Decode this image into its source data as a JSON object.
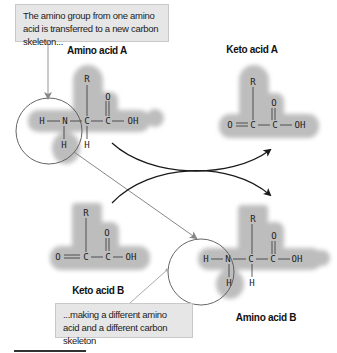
{
  "callouts": {
    "top": "The amino group from one amino acid is transferred to a new carbon skeleton...",
    "bottom": "...making a different amino acid and a different carbon skeleton"
  },
  "labels": {
    "amino_acid_a": "Amino acid A",
    "keto_acid_a": "Keto acid A",
    "keto_acid_b": "Keto acid B",
    "amino_acid_b": "Amino acid B"
  },
  "atoms": {
    "R": "R",
    "C": "C",
    "N": "N",
    "H": "H",
    "O": "O",
    "OH": "OH"
  },
  "colors": {
    "blob": "#b8b8b8",
    "callout_bg": "#e6e6e6",
    "arrow_dark": "#1a1a1a",
    "arrow_gray": "#777777",
    "circle": "#555555"
  }
}
